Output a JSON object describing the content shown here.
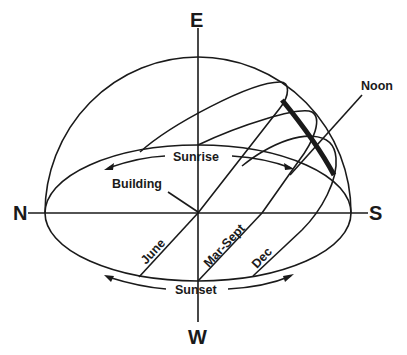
{
  "diagram": {
    "compass": {
      "east": "E",
      "west": "W",
      "north": "N",
      "south": "S"
    },
    "labels": {
      "sunrise": "Sunrise",
      "sunset": "Sunset",
      "building": "Building",
      "noon": "Noon"
    },
    "sun_paths": [
      {
        "label": "June"
      },
      {
        "label": "Mar-Sept"
      },
      {
        "label": "Dec"
      }
    ],
    "colors": {
      "line": "#1a1a1a",
      "background": "#ffffff"
    }
  }
}
